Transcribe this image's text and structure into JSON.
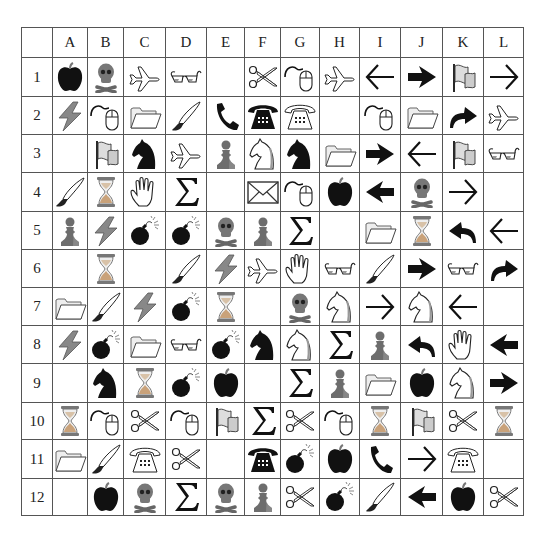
{
  "grid": {
    "corner": "",
    "columns": [
      "A",
      "B",
      "C",
      "D",
      "E",
      "F",
      "G",
      "H",
      "I",
      "J",
      "K",
      "L"
    ],
    "col_widths": [
      31,
      33,
      36,
      42,
      41,
      38,
      36,
      39,
      40,
      41,
      42,
      41,
      40
    ],
    "row_heights": [
      30,
      39,
      38,
      38,
      39,
      38,
      38,
      38,
      38,
      39,
      37,
      39,
      37
    ],
    "rows": [
      {
        "label": "1",
        "cells": [
          "apple",
          "skull",
          "airplane",
          "glasses",
          "",
          "scissors",
          "mouse",
          "airplane",
          "arrow-left-thin",
          "arrow-right-bold",
          "flag",
          "arrow-right-thin"
        ]
      },
      {
        "label": "2",
        "cells": [
          "lightning",
          "mouse",
          "folder",
          "brush",
          "handset",
          "phone-black",
          "phone-white",
          "",
          "mouse",
          "folder",
          "arrow-curved-right",
          "airplane"
        ]
      },
      {
        "label": "3",
        "cells": [
          "",
          "flag",
          "knight-black",
          "airplane",
          "pawn",
          "knight-white",
          "knight-black",
          "folder",
          "arrow-right-bold",
          "arrow-left-thin",
          "flag",
          "glasses"
        ]
      },
      {
        "label": "4",
        "cells": [
          "brush",
          "hourglass",
          "hand",
          "sigma",
          "",
          "envelope",
          "mouse",
          "apple",
          "arrow-left-bold",
          "skull",
          "arrow-right-thin",
          ""
        ]
      },
      {
        "label": "5",
        "cells": [
          "pawn",
          "lightning",
          "bomb",
          "bomb",
          "skull",
          "pawn",
          "sigma",
          "",
          "folder",
          "hourglass",
          "arrow-curved-left",
          "arrow-left-thin"
        ]
      },
      {
        "label": "6",
        "cells": [
          "",
          "hourglass",
          "",
          "brush",
          "lightning",
          "airplane",
          "hand",
          "glasses",
          "brush",
          "arrow-right-bold",
          "glasses",
          "arrow-curved-right"
        ]
      },
      {
        "label": "7",
        "cells": [
          "folder",
          "brush",
          "lightning",
          "bomb",
          "hourglass",
          "",
          "skull",
          "knight-white",
          "arrow-right-thin",
          "knight-white",
          "arrow-left-thin",
          ""
        ]
      },
      {
        "label": "8",
        "cells": [
          "lightning",
          "bomb",
          "folder",
          "glasses",
          "bomb",
          "knight-black",
          "knight-white",
          "sigma",
          "pawn",
          "arrow-curved-left",
          "hand",
          "arrow-left-bold"
        ]
      },
      {
        "label": "9",
        "cells": [
          "",
          "knight-black",
          "hourglass",
          "bomb",
          "apple",
          "",
          "sigma",
          "pawn",
          "folder",
          "apple",
          "knight-white",
          "arrow-right-bold"
        ]
      },
      {
        "label": "10",
        "cells": [
          "hourglass",
          "mouse",
          "scissors",
          "mouse",
          "flag",
          "sigma",
          "scissors",
          "mouse",
          "hourglass",
          "flag",
          "scissors",
          "hourglass"
        ]
      },
      {
        "label": "11",
        "cells": [
          "folder",
          "brush",
          "phone-white",
          "scissors",
          "",
          "phone-black",
          "bomb",
          "apple",
          "handset",
          "arrow-right-thin",
          "phone-white",
          ""
        ]
      },
      {
        "label": "12",
        "cells": [
          "",
          "apple",
          "skull",
          "sigma",
          "skull",
          "pawn",
          "scissors",
          "bomb",
          "brush",
          "arrow-left-bold",
          "apple",
          "scissors"
        ]
      }
    ]
  },
  "colors": {
    "border": "#555555",
    "ink": "#111111",
    "gray_fill": "#7a7a7a",
    "light_fill": "#d8d8d8"
  }
}
